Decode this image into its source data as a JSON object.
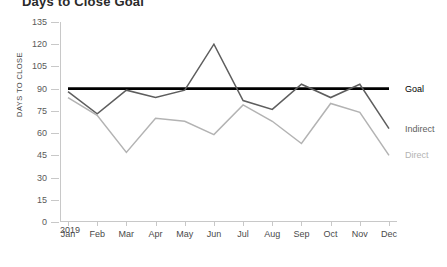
{
  "title": "Days to Close Goal",
  "axis": {
    "y_title": "DAYS TO CLOSE",
    "x_year": "2019"
  },
  "legend": [
    {
      "key": "goal",
      "label": "Goal",
      "color": "#000000"
    },
    {
      "key": "indirect",
      "label": "Indirect",
      "color": "#5e5e5e"
    },
    {
      "key": "direct",
      "label": "Direct",
      "color": "#b3b3b3"
    }
  ],
  "chart_data": {
    "type": "line",
    "title": "Days to Close Goal",
    "xlabel": "2019",
    "ylabel": "DAYS TO CLOSE",
    "categories": [
      "Jan",
      "Feb",
      "Mar",
      "Apr",
      "May",
      "Jun",
      "Jul",
      "Aug",
      "Sep",
      "Oct",
      "Nov",
      "Dec"
    ],
    "yticks": [
      0,
      15,
      30,
      45,
      60,
      75,
      90,
      105,
      120,
      135
    ],
    "ylim": [
      0,
      135
    ],
    "grid": false,
    "legend_position": "right",
    "series": [
      {
        "name": "Goal",
        "color": "#000000",
        "type": "constant-line",
        "values": [
          90,
          90,
          90,
          90,
          90,
          90,
          90,
          90,
          90,
          90,
          90,
          90
        ]
      },
      {
        "name": "Indirect",
        "color": "#5e5e5e",
        "values": [
          88,
          73,
          89,
          84,
          89,
          120,
          82,
          76,
          93,
          84,
          93,
          63
        ]
      },
      {
        "name": "Direct",
        "color": "#b3b3b3",
        "values": [
          84,
          72,
          47,
          70,
          68,
          59,
          79,
          68,
          53,
          80,
          74,
          45
        ]
      }
    ]
  }
}
